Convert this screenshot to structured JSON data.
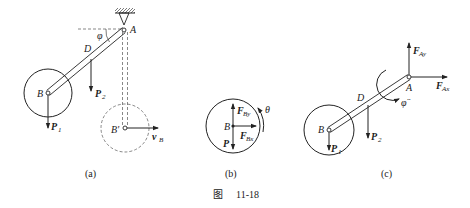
{
  "figure": {
    "caption_prefix": "图",
    "caption_number": "11-18"
  },
  "panel_a": {
    "label": "(a)",
    "point_A": "A",
    "point_B": "B",
    "point_D": "D",
    "point_B_prime": "B'",
    "angle": "φ",
    "force_P1": "P",
    "force_P1_sub": "1",
    "force_P2": "P",
    "force_P2_sub": "2",
    "velocity": "v",
    "velocity_sub": "B"
  },
  "panel_b": {
    "label": "(b)",
    "point_B": "B",
    "force_By": "F",
    "force_By_sub": "By",
    "force_Bx": "F",
    "force_Bx_sub": "Bx",
    "force_P": "P",
    "angle": "θ"
  },
  "panel_c": {
    "label": "(c)",
    "point_A": "A",
    "point_B": "B",
    "point_D": "D",
    "force_Ay": "F",
    "force_Ay_sub": "Ay",
    "force_Ax": "F",
    "force_Ax_sub": "Ax",
    "force_P1": "P",
    "force_P1_sub": "1",
    "force_P2": "P",
    "force_P2_sub": "2",
    "angular_accel": "φ̈"
  },
  "colors": {
    "ink": "#222222",
    "dash": "#555555"
  }
}
